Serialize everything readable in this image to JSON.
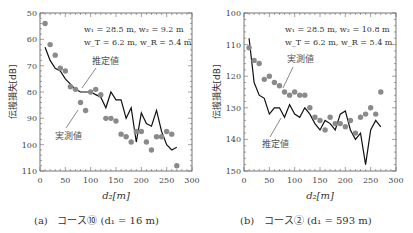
{
  "chart_data": [
    {
      "type": "scatter",
      "panel_label": "(a)",
      "caption": "コース⑩ (d1 = 16 m)",
      "caption_course": "コース⑩",
      "caption_param": "(d₁ = 16 m)",
      "xlabel": "d₂[m]",
      "ylabel": "伝搬損失[dB]",
      "xlim": [
        0,
        300
      ],
      "ylim": [
        50,
        110
      ],
      "y_inverted": true,
      "xticks": [
        0,
        50,
        100,
        150,
        200,
        250,
        300
      ],
      "yticks": [
        50,
        60,
        70,
        80,
        90,
        100,
        110
      ],
      "annotation_line1": "w₁ = 28.5 m, w₂ = 9.2 m",
      "annotation_line2": "w_T = 6.2 m, w_R = 5.4 m",
      "label_estimated": "推定値",
      "label_measured": "実測値",
      "series": [
        {
          "name": "実測値",
          "style": "marker",
          "x": [
            10,
            20,
            30,
            40,
            50,
            60,
            70,
            80,
            90,
            100,
            110,
            120,
            130,
            140,
            150,
            160,
            170,
            180,
            190,
            200,
            210,
            220,
            230,
            240,
            250,
            260,
            270
          ],
          "y": [
            54,
            62,
            66,
            71,
            72,
            78,
            79,
            84,
            87,
            80,
            79,
            81,
            90,
            90,
            91,
            96,
            97,
            99,
            95,
            95,
            99,
            102,
            97,
            97,
            95,
            96,
            108
          ]
        },
        {
          "name": "推定値",
          "style": "line",
          "x": [
            10,
            20,
            30,
            40,
            50,
            60,
            70,
            80,
            90,
            100,
            110,
            120,
            130,
            140,
            150,
            160,
            170,
            180,
            190,
            200,
            210,
            220,
            230,
            240,
            250,
            260,
            270
          ],
          "y": [
            63,
            68,
            71,
            72,
            75,
            77,
            79,
            80,
            80,
            80,
            81,
            82,
            86,
            80,
            83,
            83,
            90,
            86,
            99,
            88,
            92,
            93,
            87,
            95,
            100,
            102,
            101
          ]
        }
      ]
    },
    {
      "type": "scatter",
      "panel_label": "(b)",
      "caption": "コース② (d1 = 593 m)",
      "caption_course": "コース②",
      "caption_param": "(d₁ = 593 m)",
      "xlabel": "d₂[m]",
      "ylabel": "伝搬損失[dB]",
      "xlim": [
        0,
        300
      ],
      "ylim": [
        100,
        150
      ],
      "y_inverted": true,
      "xticks": [
        0,
        50,
        100,
        150,
        200,
        250,
        300
      ],
      "yticks": [
        100,
        110,
        120,
        130,
        140,
        150
      ],
      "annotation_line1": "w₁ = 28.5 m, w₂ = 10.8 m",
      "annotation_line2": "w_T = 6.2 m, w_R = 5.4 m",
      "label_estimated": "推定値",
      "label_measured": "実測値",
      "series": [
        {
          "name": "実測値",
          "style": "marker",
          "x": [
            10,
            20,
            30,
            40,
            50,
            60,
            70,
            80,
            90,
            100,
            110,
            120,
            130,
            140,
            150,
            160,
            170,
            180,
            190,
            200,
            210,
            220,
            230,
            240,
            250,
            260,
            270
          ],
          "y": [
            111,
            115,
            116,
            121,
            120,
            122,
            123,
            125,
            126,
            125,
            126,
            126,
            130,
            133,
            134,
            137,
            133,
            135,
            135,
            136,
            134,
            138,
            133,
            132,
            130,
            132,
            125
          ]
        },
        {
          "name": "推定値",
          "style": "line",
          "x": [
            10,
            20,
            30,
            40,
            50,
            60,
            70,
            80,
            90,
            100,
            110,
            120,
            130,
            140,
            150,
            160,
            170,
            180,
            190,
            200,
            210,
            220,
            230,
            240,
            250,
            260,
            270
          ],
          "y": [
            108,
            122,
            126,
            127,
            132,
            130,
            130,
            133,
            129,
            132,
            133,
            130,
            132,
            135,
            137,
            134,
            135,
            137,
            132,
            131,
            137,
            140,
            138,
            148,
            137,
            134,
            136
          ]
        }
      ]
    }
  ]
}
